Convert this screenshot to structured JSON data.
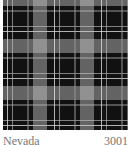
{
  "swatch": {
    "pattern": "plaid-icon",
    "colors": {
      "base": "#111111",
      "stripe_light": "#e6e6e6",
      "stripe_mid": "#969696"
    }
  },
  "caption": {
    "name": "Nevada",
    "code": "3001"
  }
}
